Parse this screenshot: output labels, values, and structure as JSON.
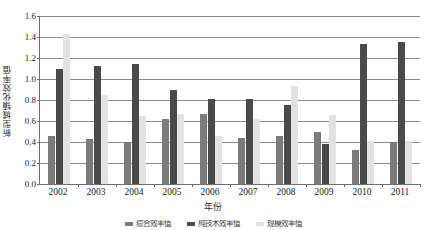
{
  "chart_data": {
    "type": "bar",
    "title": "",
    "xlabel": "年份",
    "ylabel": "新型城镇化效率值",
    "ylim": [
      0.0,
      1.6
    ],
    "ytick_labels": [
      "1.6",
      "1.4",
      "1.2",
      "1.0",
      "0.8",
      "0.6",
      "0.4",
      "0.2",
      "0.0"
    ],
    "ytick_values": [
      1.6,
      1.4,
      1.2,
      1.0,
      0.8,
      0.6,
      0.4,
      0.2,
      0.0
    ],
    "grid": true,
    "legend_position": "bottom",
    "categories": [
      "2002",
      "2003",
      "2004",
      "2005",
      "2006",
      "2007",
      "2008",
      "2009",
      "2010",
      "2011"
    ],
    "series": [
      {
        "name": "综合效率值",
        "color": "#7b7b7b",
        "values": [
          0.46,
          0.43,
          0.4,
          0.62,
          0.67,
          0.44,
          0.46,
          0.5,
          0.32,
          0.4
        ]
      },
      {
        "name": "technical-efficiency",
        "color": "#4a4a4a",
        "values": [
          1.1,
          1.12,
          1.14,
          0.9,
          0.81,
          0.81,
          0.75,
          0.38,
          1.33,
          1.35
        ]
      },
      {
        "name": "scale-efficiency",
        "color": "#e2e2e2",
        "values": [
          1.43,
          0.85,
          0.65,
          0.67,
          0.46,
          0.62,
          0.93,
          0.66,
          0.41,
          0.41
        ]
      }
    ]
  },
  "legend": {
    "items": [
      "综合效率值",
      "纯技术效率值",
      "规模效率值"
    ]
  }
}
